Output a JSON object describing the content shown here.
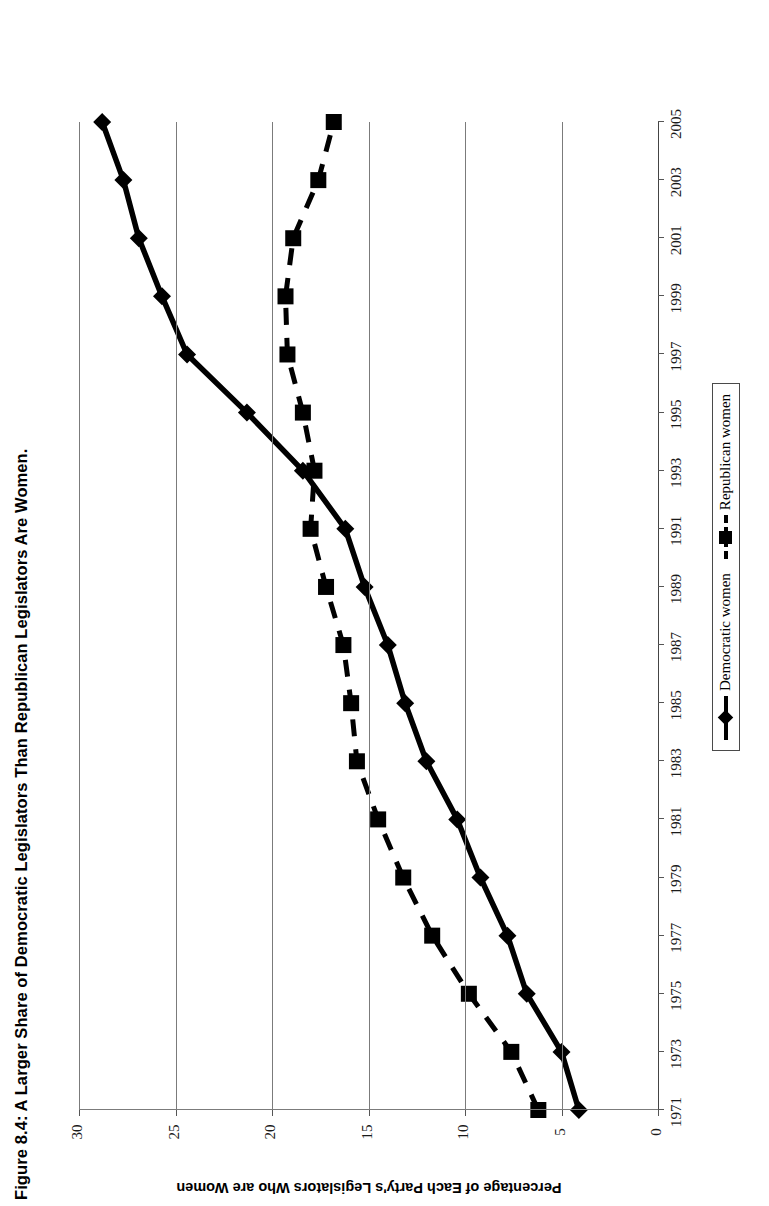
{
  "figure": {
    "title": "Figure 8.4: A Larger Share of Democratic Legislators Than Republican Legislators Are Women.",
    "value_axis_title": "Percentage of Each Party's Legislators Who are Women"
  },
  "legend": {
    "items": [
      {
        "label": "Democratic women",
        "marker": "diamond",
        "line": "solid",
        "color": "#000000"
      },
      {
        "label": "Republican women",
        "marker": "square",
        "line": "dashed",
        "color": "#000000"
      }
    ]
  },
  "axes": {
    "value_ticks": [
      "30",
      "25",
      "20",
      "15",
      "10",
      "5",
      "0"
    ],
    "category_ticks": [
      "1971",
      "1973",
      "1975",
      "1977",
      "1979",
      "1981",
      "1983",
      "1985",
      "1987",
      "1989",
      "1991",
      "1993",
      "1995",
      "1997",
      "1999",
      "2001",
      "2003",
      "2005"
    ]
  },
  "chart_data": {
    "type": "line",
    "title": "Figure 8.4: A Larger Share of Democratic Legislators Than Republican Legislators Are Women.",
    "xlabel": "",
    "ylabel": "Percentage of Each Party's Legislators Who are Women",
    "orientation": "rotated-90ccw",
    "grid": true,
    "legend_position": "bottom-right",
    "xlim": [
      1971,
      2005
    ],
    "ylim": [
      0,
      30
    ],
    "yticks": [
      0,
      5,
      10,
      15,
      20,
      25,
      30
    ],
    "xticks": [
      1971,
      1973,
      1975,
      1977,
      1979,
      1981,
      1983,
      1985,
      1987,
      1989,
      1991,
      1993,
      1995,
      1997,
      1999,
      2001,
      2003,
      2005
    ],
    "x": [
      1971,
      1973,
      1975,
      1977,
      1979,
      1981,
      1983,
      1985,
      1987,
      1989,
      1991,
      1993,
      1995,
      1997,
      1999,
      2001,
      2003,
      2005
    ],
    "series": [
      {
        "name": "Democratic women",
        "marker": "diamond",
        "line": "solid",
        "color": "#000000",
        "values": [
          4.1,
          5.0,
          6.8,
          7.8,
          9.2,
          10.4,
          12.0,
          13.1,
          14.0,
          15.2,
          16.2,
          18.4,
          21.3,
          24.4,
          25.7,
          26.9,
          27.7,
          28.8
        ]
      },
      {
        "name": "Republican women",
        "marker": "square",
        "line": "dashed",
        "color": "#000000",
        "values": [
          6.2,
          7.6,
          9.8,
          11.7,
          13.2,
          14.5,
          15.6,
          15.9,
          16.3,
          17.2,
          18.0,
          17.8,
          18.4,
          19.2,
          19.3,
          18.9,
          17.6,
          16.8
        ]
      }
    ]
  }
}
